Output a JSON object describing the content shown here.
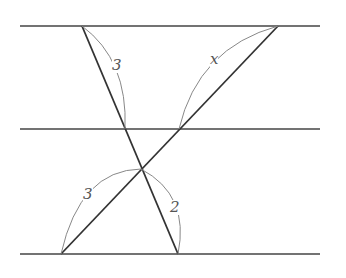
{
  "diagram": {
    "type": "geometry",
    "colors": {
      "line": "#444444",
      "arc": "#888888",
      "label": "#555555",
      "background": "#ffffff"
    },
    "parallel_lines": [
      {
        "name": "top",
        "y": 26,
        "x1": 20,
        "x2": 320
      },
      {
        "name": "middle",
        "y": 129,
        "x1": 20,
        "x2": 320
      },
      {
        "name": "bottom",
        "y": 254,
        "x1": 20,
        "x2": 320
      }
    ],
    "transversals": [
      {
        "name": "transversal-1",
        "from": [
          82,
          26
        ],
        "to": [
          178,
          254
        ]
      },
      {
        "name": "transversal-2",
        "from": [
          278,
          26
        ],
        "to": [
          61,
          254
        ]
      }
    ],
    "intersection": [
      141,
      169
    ],
    "segment_labels": [
      {
        "id": "top-left-segment",
        "text": "3",
        "x": 112,
        "y": 66
      },
      {
        "id": "top-right-segment",
        "text": "x",
        "x": 211,
        "y": 56
      },
      {
        "id": "bottom-left-segment",
        "text": "3",
        "x": 84,
        "y": 71,
        "abs_y": 191
      },
      {
        "id": "bottom-right-segment",
        "text": "2",
        "x": 172,
        "y": 209
      }
    ]
  }
}
